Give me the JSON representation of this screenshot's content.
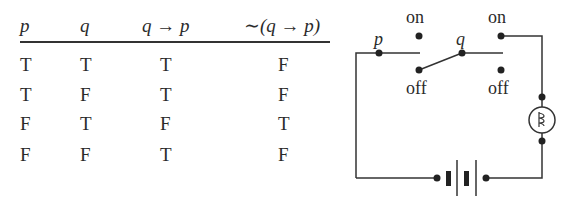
{
  "truth_table": {
    "headers": [
      "p",
      "q",
      "q → p",
      "∼(q → p)"
    ],
    "rows": [
      [
        "T",
        "T",
        "T",
        "F"
      ],
      [
        "T",
        "F",
        "T",
        "F"
      ],
      [
        "F",
        "T",
        "F",
        "T"
      ],
      [
        "F",
        "F",
        "T",
        "F"
      ]
    ]
  },
  "circuit": {
    "switch_p_label": "p",
    "switch_q_label": "q",
    "p_on_label": "on",
    "p_off_label": "off",
    "q_on_label": "on",
    "q_off_label": "off",
    "components": [
      "switch-p",
      "switch-q",
      "lamp",
      "battery"
    ]
  },
  "colors": {
    "ink": "#2a2a2a",
    "background": "#ffffff"
  }
}
